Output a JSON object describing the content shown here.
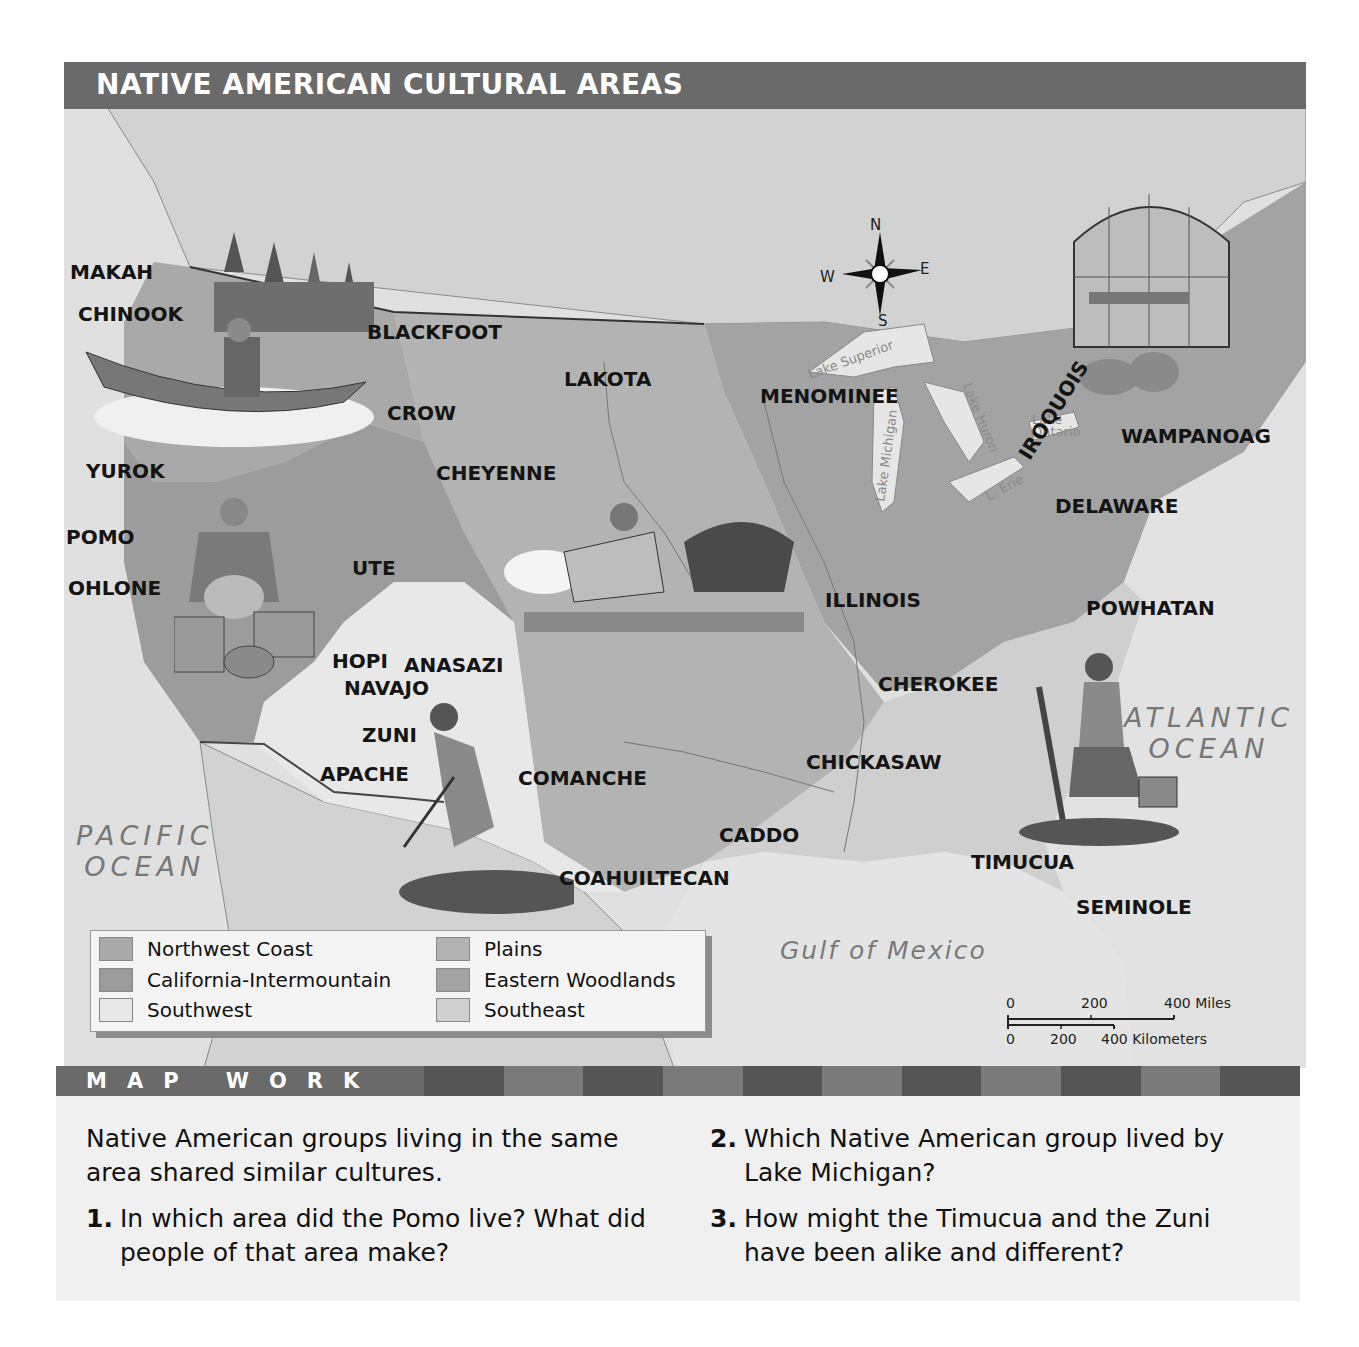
{
  "title": "NATIVE AMERICAN CULTURAL AREAS",
  "compass": {
    "n": "N",
    "s": "S",
    "e": "E",
    "w": "W"
  },
  "oceans": {
    "pacific": [
      "PACIFIC",
      "OCEAN"
    ],
    "atlantic": [
      "ATLANTIC",
      "OCEAN"
    ],
    "gulf": "Gulf of Mexico"
  },
  "lakes": {
    "superior": "Lake Superior",
    "michigan": "Lake Michigan",
    "huron": "Lake Huron",
    "erie": "L. Erie",
    "ontario": "Lake Ontario"
  },
  "groups": [
    {
      "name": "MAKAH",
      "x": 70,
      "y": 260
    },
    {
      "name": "CHINOOK",
      "x": 78,
      "y": 302
    },
    {
      "name": "BLACKFOOT",
      "x": 367,
      "y": 320
    },
    {
      "name": "LAKOTA",
      "x": 564,
      "y": 367
    },
    {
      "name": "CROW",
      "x": 387,
      "y": 401
    },
    {
      "name": "MENOMINEE",
      "x": 760,
      "y": 384
    },
    {
      "name": "YUROK",
      "x": 86,
      "y": 459
    },
    {
      "name": "CHEYENNE",
      "x": 436,
      "y": 461
    },
    {
      "name": "WAMPANOAG",
      "x": 1121,
      "y": 424
    },
    {
      "name": "DELAWARE",
      "x": 1055,
      "y": 494
    },
    {
      "name": "POMO",
      "x": 66,
      "y": 525
    },
    {
      "name": "UTE",
      "x": 352,
      "y": 556
    },
    {
      "name": "OHLONE",
      "x": 68,
      "y": 576
    },
    {
      "name": "ILLINOIS",
      "x": 825,
      "y": 588
    },
    {
      "name": "POWHATAN",
      "x": 1086,
      "y": 596
    },
    {
      "name": "HOPI",
      "x": 332,
      "y": 649
    },
    {
      "name": "ANASAZI",
      "x": 404,
      "y": 653
    },
    {
      "name": "NAVAJO",
      "x": 344,
      "y": 676
    },
    {
      "name": "CHEROKEE",
      "x": 878,
      "y": 672
    },
    {
      "name": "ZUNI",
      "x": 362,
      "y": 723
    },
    {
      "name": "CHICKASAW",
      "x": 806,
      "y": 750
    },
    {
      "name": "APACHE",
      "x": 320,
      "y": 762
    },
    {
      "name": "COMANCHE",
      "x": 518,
      "y": 766
    },
    {
      "name": "CADDO",
      "x": 719,
      "y": 823
    },
    {
      "name": "TIMUCUA",
      "x": 971,
      "y": 850
    },
    {
      "name": "COAHUILTECAN",
      "x": 559,
      "y": 866
    },
    {
      "name": "SEMINOLE",
      "x": 1076,
      "y": 895
    }
  ],
  "rotated_groups": [
    {
      "name": "IROQUOIS",
      "x": 1034,
      "y": 440,
      "rotate": -58
    }
  ],
  "legend": {
    "items": [
      {
        "label": "Northwest Coast",
        "color": "#a9a9a9"
      },
      {
        "label": "California-Intermountain",
        "color": "#9c9c9c"
      },
      {
        "label": "Southwest",
        "color": "#e8e8e8"
      },
      {
        "label": "Plains",
        "color": "#b3b3b3"
      },
      {
        "label": "Eastern Woodlands",
        "color": "#a3a3a3"
      },
      {
        "label": "Southeast",
        "color": "#cfcfcf"
      }
    ]
  },
  "scale": {
    "miles": [
      "0",
      "200",
      "400 Miles"
    ],
    "km": [
      "0",
      "200",
      "400 Kilometers"
    ]
  },
  "map_work": {
    "title": "MAP WORK",
    "intro": "Native American groups living in the same area shared similar cultures.",
    "questions": [
      {
        "num": "1.",
        "text": "In which area did the Pomo live? What did people of that area make?"
      },
      {
        "num": "2.",
        "text": "Which Native American group lived by Lake Michigan?"
      },
      {
        "num": "3.",
        "text": "How might the Timucua and the Zuni have been alike and different?"
      }
    ]
  },
  "colors": {
    "title_bar": "#6a6a6a",
    "ocean": "#e2e2e2",
    "outside_land": "#d0d0d0",
    "stripe_dark": "#555555",
    "stripe_light": "#7a7a7a"
  }
}
